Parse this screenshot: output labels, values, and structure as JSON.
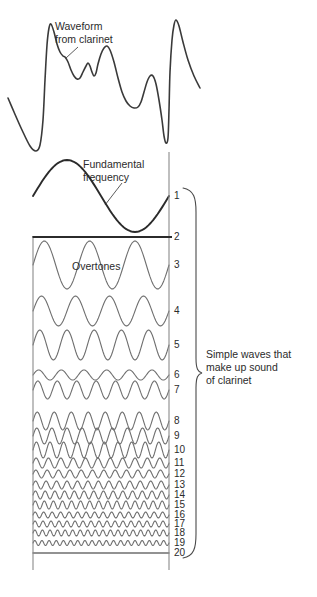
{
  "figure": {
    "annotations": {
      "waveform_label": "Waveform\nfrom clarinet",
      "fundamental_label": "Fundamental\nfrequency",
      "overtones_label": "Overtones",
      "bracket_label": "Simple waves that\nmake up sound\nof clarinet"
    },
    "colors": {
      "ink_dark": "#2b2b2b",
      "ink_mid": "#4a4a4a",
      "ink_gray": "#6f6f6f",
      "background": "#ffffff"
    },
    "axis": {
      "left_x": 33,
      "right_x": 169,
      "top_y": 237,
      "bottom_y": 570
    },
    "harmonic_numbers": [
      "1",
      "2",
      "3",
      "4",
      "5",
      "6",
      "7",
      "8",
      "9",
      "10",
      "11",
      "12",
      "13",
      "14",
      "15",
      "16",
      "17",
      "18",
      "19",
      "20"
    ]
  },
  "chart_data": {
    "type": "line",
    "subtitle": "Fourier decomposition of a clarinet tone into harmonics 1-20",
    "xlabel": "",
    "ylabel": "",
    "grid": false,
    "legend_position": "none",
    "annotations": [
      {
        "text": "Waveform from clarinet",
        "target": "composite-waveform"
      },
      {
        "text": "Fundamental frequency",
        "target": "harmonic-1"
      },
      {
        "text": "Overtones",
        "target": "harmonic-3"
      },
      {
        "text": "Simple waves that make up sound of clarinet",
        "target": "harmonic-bracket-1-20"
      }
    ],
    "series": [
      {
        "name": "Composite waveform from clarinet",
        "harmonic": 0,
        "cycles": 2,
        "relative_amplitude": 1.0,
        "description": "complex periodic wave, two periods shown"
      },
      {
        "name": "Harmonic 1 (fundamental frequency)",
        "harmonic": 1,
        "cycles": 1,
        "relative_amplitude": 1.0
      },
      {
        "name": "Harmonic 2",
        "harmonic": 2,
        "cycles": 2,
        "relative_amplitude": 0.0
      },
      {
        "name": "Harmonic 3",
        "harmonic": 3,
        "cycles": 3,
        "relative_amplitude": 0.82
      },
      {
        "name": "Harmonic 4",
        "harmonic": 4,
        "cycles": 4,
        "relative_amplitude": 0.52
      },
      {
        "name": "Harmonic 5",
        "harmonic": 5,
        "cycles": 5,
        "relative_amplitude": 0.58
      },
      {
        "name": "Harmonic 6",
        "harmonic": 6,
        "cycles": 6,
        "relative_amplitude": 0.14
      },
      {
        "name": "Harmonic 7",
        "harmonic": 7,
        "cycles": 7,
        "relative_amplitude": 0.3
      },
      {
        "name": "Harmonic 8",
        "harmonic": 8,
        "cycles": 8,
        "relative_amplitude": 0.3
      },
      {
        "name": "Harmonic 9",
        "harmonic": 9,
        "cycles": 9,
        "relative_amplitude": 0.26
      },
      {
        "name": "Harmonic 10",
        "harmonic": 10,
        "cycles": 10,
        "relative_amplitude": 0.24
      },
      {
        "name": "Harmonic 11",
        "harmonic": 11,
        "cycles": 11,
        "relative_amplitude": 0.14
      },
      {
        "name": "Harmonic 12",
        "harmonic": 12,
        "cycles": 12,
        "relative_amplitude": 0.11
      },
      {
        "name": "Harmonic 13",
        "harmonic": 13,
        "cycles": 13,
        "relative_amplitude": 0.12
      },
      {
        "name": "Harmonic 14",
        "harmonic": 14,
        "cycles": 14,
        "relative_amplitude": 0.1
      },
      {
        "name": "Harmonic 15",
        "harmonic": 15,
        "cycles": 15,
        "relative_amplitude": 0.1
      },
      {
        "name": "Harmonic 16",
        "harmonic": 16,
        "cycles": 16,
        "relative_amplitude": 0.08
      },
      {
        "name": "Harmonic 17",
        "harmonic": 17,
        "cycles": 17,
        "relative_amplitude": 0.08
      },
      {
        "name": "Harmonic 18",
        "harmonic": 18,
        "cycles": 18,
        "relative_amplitude": 0.07
      },
      {
        "name": "Harmonic 19",
        "harmonic": 19,
        "cycles": 19,
        "relative_amplitude": 0.06
      },
      {
        "name": "Harmonic 20",
        "harmonic": 20,
        "cycles": 20,
        "relative_amplitude": 0.0
      }
    ],
    "harmonic_rows": [
      {
        "number": "1",
        "center_y": 196,
        "half_height": 40,
        "cycles": 1,
        "amp": 36,
        "stroke": "#2b2b2b",
        "width": 1.9
      },
      {
        "number": "2",
        "center_y": 237,
        "half_height": 4,
        "cycles": 2,
        "amp": 0,
        "stroke": "#2b2b2b",
        "width": 1.9
      },
      {
        "number": "3",
        "center_y": 265,
        "half_height": 26,
        "cycles": 3,
        "amp": 24,
        "stroke": "#6f6f6f",
        "width": 1.1
      },
      {
        "number": "4",
        "center_y": 311,
        "half_height": 17,
        "cycles": 4,
        "amp": 15,
        "stroke": "#6f6f6f",
        "width": 1.1
      },
      {
        "number": "5",
        "center_y": 345,
        "half_height": 17,
        "cycles": 5,
        "amp": 15,
        "stroke": "#6f6f6f",
        "width": 1.1
      },
      {
        "number": "6",
        "center_y": 375,
        "half_height": 7,
        "cycles": 6,
        "amp": 5,
        "stroke": "#6f6f6f",
        "width": 1.1
      },
      {
        "number": "7",
        "center_y": 390,
        "half_height": 11,
        "cycles": 7,
        "amp": 9,
        "stroke": "#6f6f6f",
        "width": 1.1
      },
      {
        "number": "8",
        "center_y": 421,
        "half_height": 11,
        "cycles": 8,
        "amp": 9,
        "stroke": "#6f6f6f",
        "width": 1.1
      },
      {
        "number": "9",
        "center_y": 436,
        "half_height": 10,
        "cycles": 9,
        "amp": 8,
        "stroke": "#6f6f6f",
        "width": 1.1
      },
      {
        "number": "10",
        "center_y": 450,
        "half_height": 10,
        "cycles": 10,
        "amp": 8,
        "stroke": "#6f6f6f",
        "width": 1.1
      },
      {
        "number": "11",
        "center_y": 463,
        "half_height": 6,
        "cycles": 11,
        "amp": 5,
        "stroke": "#6f6f6f",
        "width": 1.1
      },
      {
        "number": "12",
        "center_y": 474,
        "half_height": 5,
        "cycles": 12,
        "amp": 4,
        "stroke": "#6f6f6f",
        "width": 1.1
      },
      {
        "number": "13",
        "center_y": 485,
        "half_height": 5,
        "cycles": 13,
        "amp": 4,
        "stroke": "#6f6f6f",
        "width": 1.1
      },
      {
        "number": "14",
        "center_y": 495,
        "half_height": 5,
        "cycles": 14,
        "amp": 4,
        "stroke": "#6f6f6f",
        "width": 1.1
      },
      {
        "number": "15",
        "center_y": 505,
        "half_height": 5,
        "cycles": 15,
        "amp": 4,
        "stroke": "#6f6f6f",
        "width": 1.1
      },
      {
        "number": "16",
        "center_y": 515,
        "half_height": 4,
        "cycles": 16,
        "amp": 3,
        "stroke": "#6f6f6f",
        "width": 1.1
      },
      {
        "number": "17",
        "center_y": 524,
        "half_height": 4,
        "cycles": 17,
        "amp": 3,
        "stroke": "#6f6f6f",
        "width": 1.1
      },
      {
        "number": "18",
        "center_y": 533,
        "half_height": 4,
        "cycles": 18,
        "amp": 3,
        "stroke": "#6f6f6f",
        "width": 1.1
      },
      {
        "number": "19",
        "center_y": 543,
        "half_height": 4,
        "cycles": 19,
        "amp": 2.5,
        "stroke": "#6f6f6f",
        "width": 1.1
      },
      {
        "number": "20",
        "center_y": 553,
        "half_height": 3,
        "cycles": 20,
        "amp": 0,
        "stroke": "#6f6f6f",
        "width": 1.3
      }
    ],
    "composite_waveform": {
      "description": "Clarinet pressure waveform, two periods, tall narrow peaks with ripples",
      "x_range": [
        8,
        200
      ],
      "y_range": [
        18,
        152
      ],
      "points": [
        [
          8,
          98
        ],
        [
          14,
          112
        ],
        [
          22,
          130
        ],
        [
          30,
          146
        ],
        [
          36,
          151
        ],
        [
          40,
          145
        ],
        [
          43,
          120
        ],
        [
          45,
          80
        ],
        [
          47,
          45
        ],
        [
          49,
          28
        ],
        [
          51,
          24
        ],
        [
          54,
          32
        ],
        [
          57,
          44
        ],
        [
          60,
          52
        ],
        [
          63,
          56
        ],
        [
          65,
          57
        ],
        [
          68,
          62
        ],
        [
          71,
          70
        ],
        [
          74,
          76
        ],
        [
          77,
          79
        ],
        [
          80,
          78
        ],
        [
          83,
          72
        ],
        [
          86,
          66
        ],
        [
          88,
          63
        ],
        [
          90,
          66
        ],
        [
          92,
          72
        ],
        [
          94,
          76
        ],
        [
          96,
          73
        ],
        [
          98,
          64
        ],
        [
          101,
          54
        ],
        [
          104,
          48
        ],
        [
          107,
          46
        ],
        [
          110,
          50
        ],
        [
          114,
          62
        ],
        [
          118,
          78
        ],
        [
          122,
          92
        ],
        [
          126,
          101
        ],
        [
          130,
          106
        ],
        [
          134,
          108
        ],
        [
          138,
          107
        ],
        [
          141,
          102
        ],
        [
          144,
          92
        ],
        [
          147,
          82
        ],
        [
          150,
          76
        ],
        [
          153,
          76
        ],
        [
          156,
          84
        ],
        [
          159,
          100
        ],
        [
          162,
          120
        ],
        [
          164,
          136
        ],
        [
          166,
          143
        ],
        [
          168,
          138
        ],
        [
          169,
          110
        ],
        [
          170,
          72
        ],
        [
          172,
          40
        ],
        [
          174,
          25
        ],
        [
          176,
          20
        ],
        [
          179,
          26
        ],
        [
          183,
          42
        ],
        [
          188,
          60
        ],
        [
          194,
          76
        ],
        [
          200,
          88
        ]
      ]
    }
  }
}
